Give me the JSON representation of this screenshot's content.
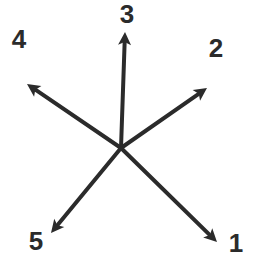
{
  "diagram": {
    "type": "radial-arrows",
    "center": {
      "x": 121,
      "y": 148
    },
    "stroke_color": "#2b2b2b",
    "background": "#ffffff",
    "arrows": [
      {
        "label": "1",
        "tip": {
          "x": 217,
          "y": 242
        },
        "label_pos": {
          "x": 236,
          "y": 252
        }
      },
      {
        "label": "2",
        "tip": {
          "x": 207,
          "y": 88
        },
        "label_pos": {
          "x": 216,
          "y": 57
        }
      },
      {
        "label": "3",
        "tip": {
          "x": 125,
          "y": 32
        },
        "label_pos": {
          "x": 127,
          "y": 23
        }
      },
      {
        "label": "4",
        "tip": {
          "x": 27,
          "y": 84
        },
        "label_pos": {
          "x": 19,
          "y": 48
        }
      },
      {
        "label": "5",
        "tip": {
          "x": 51,
          "y": 233
        },
        "label_pos": {
          "x": 36,
          "y": 250
        }
      }
    ]
  }
}
